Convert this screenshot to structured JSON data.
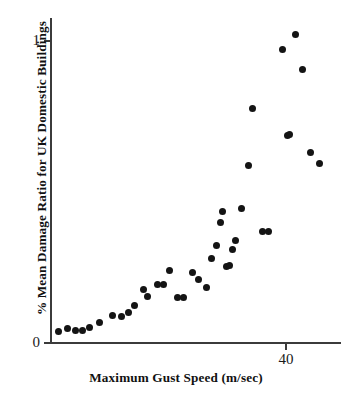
{
  "chart_data": {
    "type": "scatter",
    "title": "",
    "xlabel": "Maximum Gust Speed (m/sec)",
    "ylabel": "% Mean Damage Ratio for UK Domestic Buildings",
    "grid": false,
    "legend": null,
    "xlim": [
      19.0,
      48.5
    ],
    "ylim": [
      0,
      1.08
    ],
    "x_ticks": [
      {
        "value": 40,
        "label": "40"
      }
    ],
    "y_ticks": [
      {
        "value": 0,
        "label": "0"
      },
      {
        "value": 1,
        "label": "1"
      }
    ],
    "marker": {
      "shape": "circle",
      "color": "#141414",
      "size_px": 7
    },
    "points": [
      {
        "x": 21.3,
        "y": 0.04
      },
      {
        "x": 22.7,
        "y": 0.05
      },
      {
        "x": 23.9,
        "y": 0.043
      },
      {
        "x": 25.1,
        "y": 0.043
      },
      {
        "x": 26.2,
        "y": 0.053
      },
      {
        "x": 27.8,
        "y": 0.07
      },
      {
        "x": 29.9,
        "y": 0.093
      },
      {
        "x": 31.3,
        "y": 0.089
      },
      {
        "x": 32.4,
        "y": 0.103
      },
      {
        "x": 33.4,
        "y": 0.126
      },
      {
        "x": 34.8,
        "y": 0.179
      },
      {
        "x": 35.5,
        "y": 0.156
      },
      {
        "x": 37.1,
        "y": 0.195
      },
      {
        "x": 38.1,
        "y": 0.195
      },
      {
        "x": 39.0,
        "y": 0.242
      },
      {
        "x": 40.3,
        "y": 0.152
      },
      {
        "x": 41.3,
        "y": 0.152
      },
      {
        "x": 42.7,
        "y": 0.235
      },
      {
        "x": 43.6,
        "y": 0.215
      },
      {
        "x": 44.8,
        "y": 0.192
      },
      {
        "x": 45.6,
        "y": 0.281
      },
      {
        "x": 46.4,
        "y": 0.325
      },
      {
        "x": 47.0,
        "y": 0.404
      },
      {
        "x": 47.4,
        "y": 0.444
      },
      {
        "x": 47.8,
        "y": 0.457
      },
      {
        "x": 48.1,
        "y": 0.252
      },
      {
        "x": 48.3,
        "y": 0.255
      },
      {
        "x": 48.6,
        "y": 0.255
      },
      {
        "x": 48.9,
        "y": 0.311
      },
      {
        "x": 49.2,
        "y": 0.333
      },
      {
        "x": 49.5,
        "y": 0.573
      },
      {
        "x": 49.8,
        "y": 0.689
      },
      {
        "x": 50.1,
        "y": 0.922
      },
      {
        "x": 50.4,
        "y": 1.007
      },
      {
        "x": 50.7,
        "y": 0.833
      },
      {
        "x": 51.0,
        "y": 0.689
      },
      {
        "x": 51.3,
        "y": 0.629
      },
      {
        "x": 51.6,
        "y": 0.596
      }
    ],
    "points_px": [
      {
        "px": 58,
        "py": 331
      },
      {
        "px": 67,
        "py": 328
      },
      {
        "px": 75,
        "py": 330
      },
      {
        "px": 82,
        "py": 330
      },
      {
        "px": 89,
        "py": 327
      },
      {
        "px": 99,
        "py": 322
      },
      {
        "px": 112,
        "py": 315
      },
      {
        "px": 121,
        "py": 316
      },
      {
        "px": 128,
        "py": 312
      },
      {
        "px": 134,
        "py": 305
      },
      {
        "px": 143,
        "py": 289
      },
      {
        "px": 147,
        "py": 296
      },
      {
        "px": 157,
        "py": 284
      },
      {
        "px": 163,
        "py": 284
      },
      {
        "px": 169,
        "py": 270
      },
      {
        "px": 177,
        "py": 297
      },
      {
        "px": 183,
        "py": 297
      },
      {
        "px": 192,
        "py": 272
      },
      {
        "px": 198,
        "py": 278
      },
      {
        "px": 205,
        "py": 285
      },
      {
        "px": 210,
        "py": 258
      },
      {
        "px": 215,
        "py": 245
      },
      {
        "px": 219,
        "py": 221
      },
      {
        "px": 222,
        "py": 209
      },
      {
        "px": 224,
        "py": 205
      },
      {
        "px": 226,
        "py": 267
      },
      {
        "px": 228,
        "py": 266
      },
      {
        "px": 230,
        "py": 266
      },
      {
        "px": 232,
        "py": 249
      },
      {
        "px": 234,
        "py": 242
      },
      {
        "px": 236,
        "py": 170
      },
      {
        "px": 238,
        "py": 135
      },
      {
        "px": 240,
        "py": 65
      },
      {
        "px": 242,
        "py": 39
      },
      {
        "px": 244,
        "py": 91
      },
      {
        "px": 246,
        "py": 135
      },
      {
        "px": 248,
        "py": 153
      },
      {
        "px": 250,
        "py": 163
      }
    ]
  },
  "plot_geometry": {
    "x_axis_px": {
      "left": 50,
      "right": 341,
      "y": 343
    },
    "y_axis_px": {
      "x": 50,
      "top": 18,
      "bottom": 343
    },
    "x_tick_40_px": 285,
    "y_tick_0_px": 343,
    "y_tick_1_px": 41
  },
  "rendered_points_px": [
    {
      "px": 58,
      "py": 331
    },
    {
      "px": 67,
      "py": 328
    },
    {
      "px": 75,
      "py": 330
    },
    {
      "px": 82,
      "py": 330
    },
    {
      "px": 89,
      "py": 327
    },
    {
      "px": 99,
      "py": 322
    },
    {
      "px": 112,
      "py": 315
    },
    {
      "px": 121,
      "py": 316
    },
    {
      "px": 128,
      "py": 312
    },
    {
      "px": 134,
      "py": 305
    },
    {
      "px": 143,
      "py": 289
    },
    {
      "px": 147,
      "py": 296
    },
    {
      "px": 157,
      "py": 284
    },
    {
      "px": 163,
      "py": 284
    },
    {
      "px": 169,
      "py": 270
    },
    {
      "px": 177,
      "py": 297
    },
    {
      "px": 183,
      "py": 297
    },
    {
      "px": 192,
      "py": 272
    },
    {
      "px": 198,
      "py": 279
    },
    {
      "px": 206,
      "py": 287
    },
    {
      "px": 211,
      "py": 258
    },
    {
      "px": 216,
      "py": 245
    },
    {
      "px": 220,
      "py": 222
    },
    {
      "px": 222,
      "py": 211
    },
    {
      "px": 226,
      "py": 266
    },
    {
      "px": 229,
      "py": 265
    },
    {
      "px": 232,
      "py": 249
    },
    {
      "px": 235,
      "py": 240
    },
    {
      "px": 241,
      "py": 208
    },
    {
      "px": 248,
      "py": 165
    },
    {
      "px": 252,
      "py": 108
    },
    {
      "px": 262,
      "py": 231
    },
    {
      "px": 268,
      "py": 231
    },
    {
      "px": 282,
      "py": 49
    },
    {
      "px": 287,
      "py": 135
    },
    {
      "px": 289,
      "py": 134
    },
    {
      "px": 295,
      "py": 34
    },
    {
      "px": 302,
      "py": 69
    },
    {
      "px": 310,
      "py": 152
    },
    {
      "px": 319,
      "py": 163
    }
  ]
}
